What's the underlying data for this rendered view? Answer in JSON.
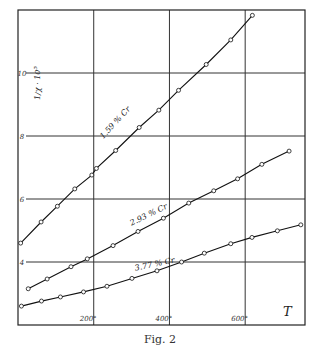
{
  "caption": "Fig. 2",
  "chart_data": {
    "type": "line",
    "title": "",
    "xlabel": "T",
    "ylabel": "1/χ · 10⁵",
    "xlim": [
      0,
      758
    ],
    "ylim": [
      2,
      12
    ],
    "grid": true,
    "x_ticks": [
      200,
      400,
      600
    ],
    "x_tick_labels": [
      "200°",
      "400°",
      "600°"
    ],
    "y_ticks": [
      4,
      6,
      8,
      10
    ],
    "y_tick_labels": [
      "4",
      "6",
      "8",
      "10"
    ],
    "legend": "inline labels on curves",
    "series": [
      {
        "name": "1.59 % Cr",
        "label_pos": {
          "T": 225,
          "y": 7.9,
          "angle": -47
        },
        "points": [
          [
            7,
            4.6
          ],
          [
            61,
            5.27
          ],
          [
            104,
            5.77
          ],
          [
            150,
            6.32
          ],
          [
            195,
            6.76
          ],
          [
            207,
            6.97
          ],
          [
            258,
            7.54
          ],
          [
            320,
            8.27
          ],
          [
            372,
            8.82
          ],
          [
            424,
            9.45
          ],
          [
            497,
            10.27
          ],
          [
            562,
            11.05
          ],
          [
            619,
            11.83
          ]
        ]
      },
      {
        "name": "2.93 % Cr",
        "label_pos": {
          "T": 300,
          "y": 5.15,
          "angle": -26
        },
        "points": [
          [
            27,
            3.15
          ],
          [
            77,
            3.46
          ],
          [
            140,
            3.85
          ],
          [
            183,
            4.1
          ],
          [
            251,
            4.52
          ],
          [
            317,
            4.97
          ],
          [
            384,
            5.39
          ],
          [
            451,
            5.87
          ],
          [
            517,
            6.26
          ],
          [
            580,
            6.64
          ],
          [
            644,
            7.1
          ],
          [
            716,
            7.52
          ]
        ]
      },
      {
        "name": "3.77 % Cr",
        "label_pos": {
          "T": 310,
          "y": 3.72,
          "angle": -12
        },
        "points": [
          [
            9,
            2.6
          ],
          [
            62,
            2.76
          ],
          [
            112,
            2.89
          ],
          [
            173,
            3.05
          ],
          [
            235,
            3.23
          ],
          [
            301,
            3.48
          ],
          [
            367,
            3.72
          ],
          [
            432,
            4.0
          ],
          [
            492,
            4.28
          ],
          [
            562,
            4.58
          ],
          [
            618,
            4.78
          ],
          [
            685,
            4.99
          ],
          [
            747,
            5.18
          ]
        ]
      }
    ]
  }
}
